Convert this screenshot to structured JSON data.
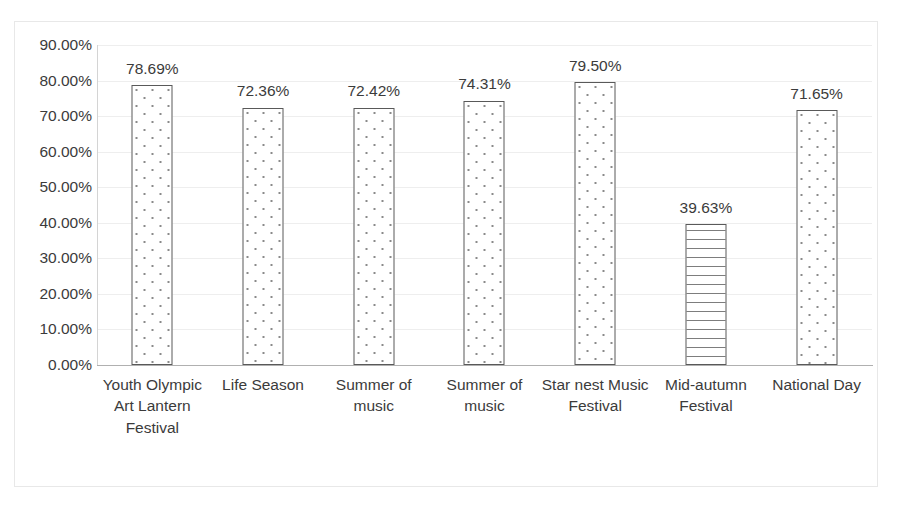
{
  "chart_data": {
    "type": "bar",
    "title": "",
    "subtitle": "",
    "xlabel": "",
    "ylabel": "",
    "ylim": [
      0,
      0.9
    ],
    "grid": true,
    "legend": "none",
    "y_tick_labels": [
      "90.00%",
      "80.00%",
      "70.00%",
      "60.00%",
      "50.00%",
      "40.00%",
      "30.00%",
      "20.00%",
      "10.00%",
      "0.00%"
    ],
    "y_tick_values": [
      0.9,
      0.8,
      0.7,
      0.6,
      0.5,
      0.4,
      0.3,
      0.2,
      0.1,
      0.0
    ],
    "categories": [
      "Youth Olympic Art Lantern Festival",
      "Life Season",
      "Summer of music",
      "Summer of music",
      "Star nest Music Festival",
      "Mid-autumn Festival",
      "National Day"
    ],
    "values": [
      0.7869,
      0.7236,
      0.7242,
      0.7431,
      0.795,
      0.3963,
      0.7165
    ],
    "data_labels": [
      "78.69%",
      "72.36%",
      "72.42%",
      "74.31%",
      "79.50%",
      "39.63%",
      "71.65%"
    ],
    "bar_patterns": [
      "dots",
      "dots",
      "dots",
      "dots",
      "dots",
      "wave",
      "dots"
    ],
    "colors": {
      "bar_outline": "#595959",
      "bar_fill": "#ffffff",
      "pattern": "#8a8a8a",
      "gridline": "#eeeeee",
      "axis": "#b0b0b0",
      "text": "#3b3b3b",
      "frame": "#e8e8e8",
      "background": "#ffffff"
    }
  }
}
